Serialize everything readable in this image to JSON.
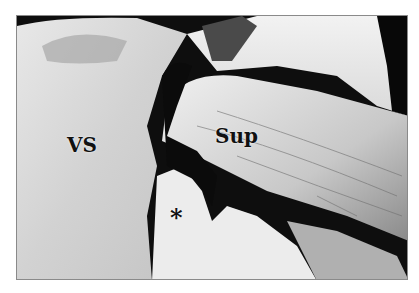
{
  "figure": {
    "labels": {
      "vs": "VS",
      "sup": "Sup",
      "asterisk": "*"
    }
  }
}
